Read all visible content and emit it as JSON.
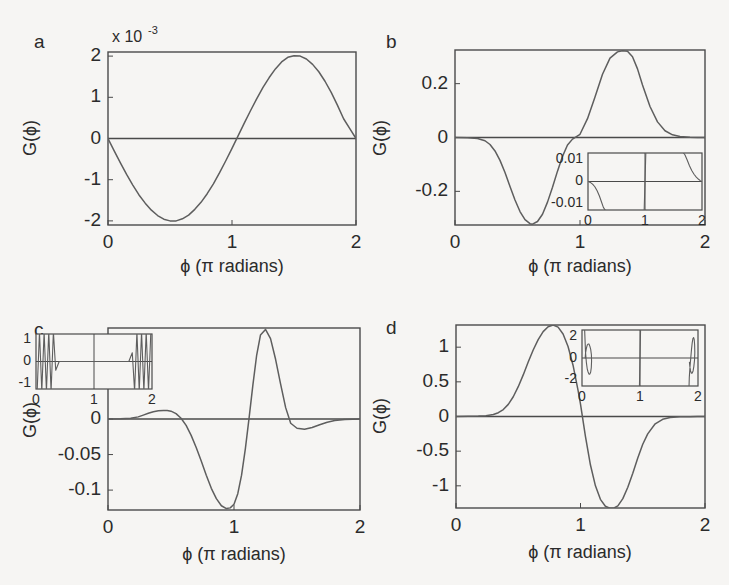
{
  "figure": {
    "background_color": "#f6f5f3",
    "ink_color": "#4a4a4a",
    "curve_color": "#5e5e5e"
  },
  "common": {
    "xlabel": "ϕ (π radians)",
    "ylabel": "G(ϕ)",
    "x_ticks": [
      "0",
      "1",
      "2"
    ],
    "inset_x_ticks": [
      "0",
      "1",
      "2"
    ],
    "exp_prefix": "x 10",
    "exp_power": "-3"
  },
  "chart_data": [
    {
      "id": "a",
      "letter": "a",
      "type": "line",
      "title": "",
      "xlabel": "ϕ (π radians)",
      "ylabel": "G(ϕ)",
      "xlim": [
        0,
        2
      ],
      "ylim": [
        -0.0021,
        0.0021
      ],
      "x_ticks": [
        0,
        1,
        2
      ],
      "x_tick_labels": [
        "0",
        "1",
        "2"
      ],
      "y_ticks": [
        -0.002,
        -0.001,
        0,
        0.001,
        0.002
      ],
      "y_tick_labels": [
        "-2",
        "-1",
        "0",
        "1",
        "2"
      ],
      "y_exponent": "x 10^-3",
      "grid": false,
      "legend": null,
      "has_inset": false,
      "series": [
        {
          "name": "G",
          "x": [
            0.0,
            0.05,
            0.1,
            0.15,
            0.2,
            0.25,
            0.3,
            0.35,
            0.4,
            0.45,
            0.5,
            0.55,
            0.6,
            0.65,
            0.7,
            0.75,
            0.8,
            0.85,
            0.9,
            0.95,
            1.0,
            1.05,
            1.1,
            1.15,
            1.2,
            1.25,
            1.3,
            1.35,
            1.4,
            1.45,
            1.5,
            1.55,
            1.6,
            1.65,
            1.7,
            1.75,
            1.8,
            1.85,
            1.9,
            1.95,
            2.0
          ],
          "y": [
            0.0,
            -0.0003,
            -0.00059,
            -0.00087,
            -0.00113,
            -0.00137,
            -0.00157,
            -0.00174,
            -0.00187,
            -0.00196,
            -0.002,
            -0.002,
            -0.00195,
            -0.00186,
            -0.00172,
            -0.00155,
            -0.00134,
            -0.0011,
            -0.00083,
            -0.00054,
            -0.00024,
            7e-05,
            0.00038,
            0.00068,
            0.00097,
            0.00124,
            0.00148,
            0.00169,
            0.00186,
            0.00197,
            0.00201,
            0.002,
            0.00193,
            0.0018,
            0.00162,
            0.00139,
            0.00112,
            0.00081,
            0.00048,
            0.00024,
            0.0
          ]
        }
      ]
    },
    {
      "id": "b",
      "letter": "b",
      "type": "line",
      "title": "",
      "xlabel": "ϕ (π radians)",
      "ylabel": "G(ϕ)",
      "xlim": [
        0,
        2
      ],
      "ylim": [
        -0.325,
        0.325
      ],
      "x_ticks": [
        0,
        1,
        2
      ],
      "x_tick_labels": [
        "0",
        "1",
        "2"
      ],
      "y_ticks": [
        -0.2,
        0,
        0.2
      ],
      "y_tick_labels": [
        "-0.2",
        "0",
        "0.2"
      ],
      "y_exponent": null,
      "grid": false,
      "legend": null,
      "has_inset": true,
      "series": [
        {
          "name": "G",
          "x": [
            0.0,
            0.1,
            0.18,
            0.24,
            0.28,
            0.32,
            0.36,
            0.4,
            0.44,
            0.48,
            0.52,
            0.56,
            0.6,
            0.62,
            0.66,
            0.7,
            0.74,
            0.78,
            0.82,
            0.86,
            0.9,
            0.94,
            1.0,
            1.06,
            1.12,
            1.18,
            1.24,
            1.3,
            1.34,
            1.38,
            1.42,
            1.46,
            1.5,
            1.56,
            1.62,
            1.68,
            1.74,
            1.8,
            1.88,
            1.94,
            2.0
          ],
          "y": [
            0.0,
            -0.001,
            -0.004,
            -0.012,
            -0.026,
            -0.05,
            -0.085,
            -0.13,
            -0.182,
            -0.232,
            -0.275,
            -0.305,
            -0.32,
            -0.322,
            -0.312,
            -0.285,
            -0.24,
            -0.185,
            -0.125,
            -0.07,
            -0.028,
            -0.006,
            0.012,
            0.07,
            0.15,
            0.235,
            0.295,
            0.318,
            0.322,
            0.32,
            0.3,
            0.255,
            0.195,
            0.115,
            0.058,
            0.025,
            0.01,
            0.004,
            0.001,
            0.0,
            0.0
          ]
        }
      ],
      "inset": {
        "xlim": [
          0,
          2
        ],
        "ylim": [
          -0.013,
          0.013
        ],
        "x_ticks": [
          0,
          1,
          2
        ],
        "x_tick_labels": [
          "0",
          "1",
          "2"
        ],
        "y_ticks": [
          -0.01,
          0,
          0.01
        ],
        "y_tick_labels": [
          "-0.01",
          "0",
          "0.01"
        ],
        "series": [
          {
            "name": "G-zoom-left",
            "x": [
              0.0,
              0.04,
              0.08,
              0.12,
              0.16,
              0.2,
              0.24,
              0.27,
              0.3,
              0.33
            ],
            "y": [
              0.0,
              -0.0004,
              -0.0012,
              -0.0024,
              -0.0042,
              -0.0066,
              -0.0096,
              -0.0118,
              -0.013,
              -0.0135
            ]
          },
          {
            "name": "G-zoom-crossing",
            "x": [
              0.985,
              1.0,
              1.015
            ],
            "y": [
              -0.0135,
              0.0,
              0.0135
            ]
          },
          {
            "name": "G-zoom-right",
            "x": [
              1.66,
              1.7,
              1.74,
              1.78,
              1.82,
              1.86,
              1.9,
              1.94,
              1.97,
              2.0
            ],
            "y": [
              0.0135,
              0.0122,
              0.0098,
              0.0072,
              0.005,
              0.0033,
              0.002,
              0.001,
              0.0004,
              0.0
            ]
          }
        ]
      }
    },
    {
      "id": "c",
      "letter": "c",
      "type": "line",
      "title": "",
      "xlabel": "ϕ (π radians)",
      "ylabel": "G(ϕ)",
      "xlim": [
        0,
        2
      ],
      "ylim": [
        -0.128,
        0.128
      ],
      "x_ticks": [
        0,
        1,
        2
      ],
      "x_tick_labels": [
        "0",
        "1",
        "2"
      ],
      "y_ticks": [
        -0.1,
        -0.05,
        0,
        0.05,
        0.1
      ],
      "y_tick_labels": [
        "-0.1",
        "-0.05",
        "0",
        "0.05",
        "0.1"
      ],
      "y_exponent": null,
      "grid": false,
      "legend": null,
      "has_inset": true,
      "series": [
        {
          "name": "G",
          "x": [
            0.0,
            0.1,
            0.18,
            0.24,
            0.28,
            0.32,
            0.36,
            0.4,
            0.44,
            0.47,
            0.5,
            0.54,
            0.58,
            0.62,
            0.66,
            0.7,
            0.74,
            0.78,
            0.82,
            0.86,
            0.9,
            0.94,
            0.97,
            1.0,
            1.03,
            1.06,
            1.09,
            1.12,
            1.15,
            1.18,
            1.21,
            1.25,
            1.29,
            1.33,
            1.37,
            1.41,
            1.45,
            1.5,
            1.56,
            1.62,
            1.68,
            1.74,
            1.8,
            1.88,
            1.94,
            2.0
          ],
          "y": [
            0.0,
            0.0002,
            0.001,
            0.003,
            0.0055,
            0.008,
            0.0102,
            0.0116,
            0.0121,
            0.012,
            0.011,
            0.0075,
            0.001,
            -0.009,
            -0.023,
            -0.04,
            -0.059,
            -0.079,
            -0.0975,
            -0.112,
            -0.122,
            -0.126,
            -0.125,
            -0.12,
            -0.105,
            -0.079,
            -0.042,
            0.002,
            0.048,
            0.09,
            0.118,
            0.126,
            0.113,
            0.084,
            0.049,
            0.016,
            -0.006,
            -0.013,
            -0.0145,
            -0.012,
            -0.008,
            -0.0045,
            -0.0022,
            -0.0008,
            -0.0003,
            0.0
          ]
        }
      ],
      "inset": {
        "xlim": [
          0,
          2
        ],
        "ylim": [
          -0.00125,
          0.00125
        ],
        "x_ticks": [
          0,
          1,
          2
        ],
        "x_tick_labels": [
          "0",
          "1",
          "2"
        ],
        "y_ticks": [
          -0.001,
          0,
          0.001
        ],
        "y_tick_labels": [
          "-1",
          "0",
          "1"
        ],
        "y_exponent": "x 10^-3",
        "series": [
          {
            "name": "G-zoom-oscillation",
            "x": [
              0.02,
              0.06,
              0.1,
              0.14,
              0.18,
              0.22,
              0.26,
              0.3,
              0.34,
              0.4,
              0.48,
              0.56,
              0.64,
              0.72,
              0.8,
              0.88,
              0.96,
              1.0,
              1.04,
              1.12,
              1.2,
              1.28,
              1.36,
              1.44,
              1.52,
              1.6,
              1.66,
              1.7,
              1.74,
              1.78,
              1.82,
              1.86,
              1.9,
              1.94,
              1.98
            ],
            "y": [
              -0.00135,
              0.00135,
              -0.00135,
              0.00135,
              -0.00135,
              0.00135,
              -0.00135,
              0.00135,
              -0.0004,
              0.0,
              0.0,
              0.0,
              0.0,
              0.0,
              0.0,
              0.0,
              0.0,
              0.0,
              0.0,
              0.0,
              0.0,
              0.0,
              0.0,
              0.0,
              0.0,
              0.0,
              0.0004,
              -0.00135,
              0.00135,
              -0.00135,
              0.00135,
              -0.00135,
              0.00135,
              -0.00135,
              0.00135
            ]
          }
        ]
      }
    },
    {
      "id": "d",
      "letter": "d",
      "type": "line",
      "title": "",
      "xlabel": "ϕ (π radians)",
      "ylabel": "G(ϕ)",
      "xlim": [
        0,
        2
      ],
      "ylim": [
        -1.32,
        1.32
      ],
      "x_ticks": [
        0,
        1,
        2
      ],
      "x_tick_labels": [
        "0",
        "1",
        "2"
      ],
      "y_ticks": [
        -1,
        -0.5,
        0,
        0.5,
        1
      ],
      "y_tick_labels": [
        "-1",
        "-0.5",
        "0",
        "0.5",
        "1"
      ],
      "y_exponent": null,
      "grid": false,
      "legend": null,
      "has_inset": true,
      "series": [
        {
          "name": "G",
          "x": [
            0.0,
            0.1,
            0.18,
            0.24,
            0.3,
            0.34,
            0.38,
            0.42,
            0.46,
            0.5,
            0.54,
            0.58,
            0.62,
            0.66,
            0.7,
            0.74,
            0.78,
            0.82,
            0.86,
            0.9,
            0.94,
            0.98,
            1.0,
            1.04,
            1.08,
            1.12,
            1.16,
            1.2,
            1.24,
            1.27,
            1.3,
            1.34,
            1.38,
            1.42,
            1.46,
            1.5,
            1.54,
            1.6,
            1.66,
            1.72,
            1.8,
            1.88,
            1.94,
            2.0
          ],
          "y": [
            0.0,
            0.002,
            0.006,
            0.012,
            0.028,
            0.055,
            0.1,
            0.175,
            0.285,
            0.43,
            0.6,
            0.785,
            0.96,
            1.11,
            1.225,
            1.295,
            1.32,
            1.29,
            1.19,
            1.01,
            0.74,
            0.38,
            0.18,
            -0.29,
            -0.7,
            -1.0,
            -1.195,
            -1.295,
            -1.325,
            -1.32,
            -1.29,
            -1.185,
            -1.02,
            -0.82,
            -0.6,
            -0.4,
            -0.25,
            -0.105,
            -0.04,
            -0.015,
            -0.005,
            -0.002,
            -0.001,
            0.0
          ]
        }
      ],
      "inset": {
        "xlim": [
          0,
          2
        ],
        "ylim": [
          -0.0026,
          0.0026
        ],
        "x_ticks": [
          0,
          1,
          2
        ],
        "x_tick_labels": [
          "0",
          "1",
          "2"
        ],
        "y_ticks": [
          -0.002,
          0,
          0.002
        ],
        "y_tick_labels": [
          "-2",
          "0",
          "2"
        ],
        "y_exponent": "x 10^-3",
        "series": [
          {
            "name": "G-zoom-left-lobe",
            "x": [
              0.045,
              0.05,
              0.06,
              0.075,
              0.09,
              0.105,
              0.12,
              0.135,
              0.15,
              0.16,
              0.165,
              0.162,
              0.15,
              0.135,
              0.12,
              0.105,
              0.09,
              0.075,
              0.062,
              0.055
            ],
            "y": [
              0.0027,
              0.002,
              0.0006,
              -0.0004,
              -0.001,
              -0.0013,
              -0.0015,
              -0.0015,
              -0.0013,
              -0.0009,
              -0.0003,
              0.0003,
              0.0008,
              0.0011,
              0.0013,
              0.0013,
              0.0012,
              0.0009,
              0.0005,
              0.0
            ]
          },
          {
            "name": "G-zoom-crossing",
            "x": [
              0.99,
              1.0,
              1.01
            ],
            "y": [
              -0.0027,
              0.0,
              0.0027
            ]
          },
          {
            "name": "G-zoom-right-lobe",
            "x": [
              1.845,
              1.85,
              1.862,
              1.875,
              1.888,
              1.9,
              1.912,
              1.925,
              1.935,
              1.942,
              1.945,
              1.94,
              1.928,
              1.915,
              1.9,
              1.885,
              1.872,
              1.86,
              1.852
            ],
            "y": [
              -0.0027,
              -0.0018,
              -0.0008,
              0.0,
              0.0008,
              0.0014,
              0.0018,
              0.0019,
              0.0017,
              0.0012,
              0.0005,
              -0.0002,
              -0.0008,
              -0.0012,
              -0.0014,
              -0.0014,
              -0.0012,
              -0.0008,
              -0.0004
            ]
          }
        ]
      }
    }
  ]
}
